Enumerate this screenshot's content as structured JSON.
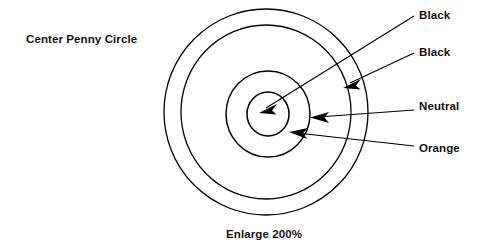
{
  "figure": {
    "title": "Center Penny Circle",
    "footer_note": "Enlarge 200%",
    "background_color": "#ffffff",
    "line_color": "#000000"
  },
  "target": {
    "center_x": 266,
    "center_y": 112,
    "ring_count": 4,
    "rings": [
      {
        "index": 1,
        "name": "outer-ring",
        "radius_x": 102,
        "radius_y": 103,
        "stroke_width": 1.3,
        "color_label": "Black"
      },
      {
        "index": 2,
        "name": "second-ring",
        "radius_x": 85,
        "radius_y": 87,
        "stroke_width": 1.3,
        "color_label": "Black"
      },
      {
        "index": 3,
        "name": "third-ring",
        "radius_x": 42,
        "radius_y": 43,
        "stroke_width": 1.4,
        "color_label": "Orange"
      },
      {
        "index": 4,
        "name": "inner-ring",
        "radius_x": 21,
        "radius_y": 22,
        "stroke_width": 1.5,
        "color_label": "Neutral"
      }
    ]
  },
  "callouts": [
    {
      "id": "black-outer",
      "label": "Black",
      "points_to": "inner-ring",
      "line": {
        "x1": 414,
        "y1": 16,
        "x2": 262,
        "y2": 110
      },
      "arrow_at": {
        "x": 261,
        "y": 111,
        "angle": 148
      }
    },
    {
      "id": "black-second",
      "label": "Black",
      "points_to": "second-ring",
      "line": {
        "x1": 414,
        "y1": 53,
        "x2": 348,
        "y2": 85
      },
      "arrow_at": {
        "x": 347,
        "y": 86,
        "angle": 154
      }
    },
    {
      "id": "neutral",
      "label": "Neutral",
      "points_to": "third-ring-right",
      "line": {
        "x1": 414,
        "y1": 110,
        "x2": 314,
        "y2": 117
      },
      "arrow_at": {
        "x": 313,
        "y": 117,
        "angle": 184
      }
    },
    {
      "id": "orange",
      "label": "Orange",
      "points_to": "third-ring-lower",
      "line": {
        "x1": 414,
        "y1": 146,
        "x2": 293,
        "y2": 133
      },
      "arrow_at": {
        "x": 292,
        "y": 133,
        "angle": 186
      }
    }
  ]
}
